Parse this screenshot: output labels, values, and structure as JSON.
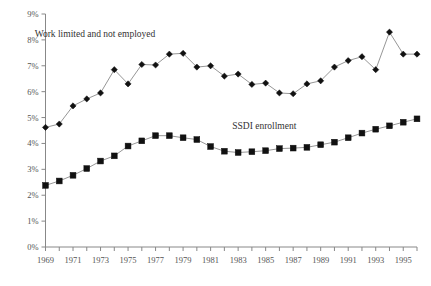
{
  "chart_data": {
    "type": "line",
    "title": "",
    "subtitle": "",
    "xlabel": "",
    "ylabel": "",
    "grid": false,
    "legend_position": "inline-annotations",
    "ylim": [
      0,
      9
    ],
    "ytick_labels": [
      "0%",
      "1%",
      "2%",
      "3%",
      "4%",
      "5%",
      "6%",
      "7%",
      "8%",
      "9%"
    ],
    "ytick_values": [
      0,
      1,
      2,
      3,
      4,
      5,
      6,
      7,
      8,
      9
    ],
    "xlim": [
      1969,
      1996
    ],
    "x": [
      1969,
      1970,
      1971,
      1972,
      1973,
      1974,
      1975,
      1976,
      1977,
      1978,
      1979,
      1980,
      1981,
      1982,
      1983,
      1984,
      1985,
      1986,
      1987,
      1988,
      1989,
      1990,
      1991,
      1992,
      1993,
      1994,
      1995,
      1996
    ],
    "xtick_values": [
      1969,
      1970,
      1971,
      1972,
      1973,
      1974,
      1975,
      1976,
      1977,
      1978,
      1979,
      1980,
      1981,
      1982,
      1983,
      1984,
      1985,
      1986,
      1987,
      1988,
      1989,
      1990,
      1991,
      1992,
      1993,
      1994,
      1995,
      1996
    ],
    "xtick_labels_shown": [
      "1969",
      "1971",
      "1973",
      "1975",
      "1977",
      "1979",
      "1981",
      "1983",
      "1985",
      "1987",
      "1989",
      "1991",
      "1993",
      "1995"
    ],
    "xtick_labeled_values": [
      1969,
      1971,
      1973,
      1975,
      1977,
      1979,
      1981,
      1983,
      1985,
      1987,
      1989,
      1991,
      1993,
      1995
    ],
    "series": [
      {
        "name": "Work limited and not employed",
        "marker": "diamond",
        "color": "#111111",
        "label_position": {
          "x": 1972.6,
          "y": 8.12
        },
        "values": [
          4.62,
          4.75,
          5.45,
          5.72,
          5.95,
          6.85,
          6.3,
          7.05,
          7.03,
          7.45,
          7.48,
          6.95,
          7.0,
          6.6,
          6.68,
          6.28,
          6.33,
          5.95,
          5.92,
          6.3,
          6.42,
          6.95,
          7.2,
          7.35,
          6.85,
          8.3,
          7.45,
          7.45
        ]
      },
      {
        "name": "SSDI enrollment",
        "marker": "square",
        "color": "#111111",
        "label_position": {
          "x": 1984.9,
          "y": 4.55
        },
        "values": [
          2.38,
          2.55,
          2.77,
          3.03,
          3.32,
          3.52,
          3.9,
          4.1,
          4.3,
          4.3,
          4.22,
          4.15,
          3.88,
          3.7,
          3.65,
          3.68,
          3.72,
          3.8,
          3.82,
          3.85,
          3.95,
          4.05,
          4.22,
          4.4,
          4.55,
          4.68,
          4.82,
          4.95
        ]
      }
    ]
  }
}
